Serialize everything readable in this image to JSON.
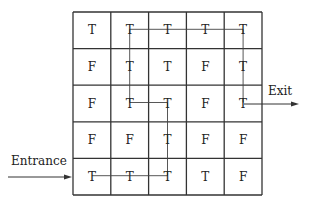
{
  "grid": {
    "rows": 5,
    "cols": 5,
    "x0": 73,
    "y0": 12,
    "cell_w": 37.8,
    "cell_h": 36.6,
    "cells": [
      [
        "T",
        "T",
        "T",
        "T",
        "T"
      ],
      [
        "F",
        "T",
        "T",
        "F",
        "T"
      ],
      [
        "F",
        "T",
        "T",
        "F",
        "T"
      ],
      [
        "F",
        "F",
        "T",
        "F",
        "F"
      ],
      [
        "T",
        "T",
        "T",
        "T",
        "F"
      ]
    ]
  },
  "path": {
    "description": "Route from entrance to exit through T cells",
    "cells": [
      [
        4,
        0
      ],
      [
        4,
        1
      ],
      [
        4,
        2
      ],
      [
        3,
        2
      ],
      [
        2,
        2
      ],
      [
        2,
        1
      ],
      [
        1,
        1
      ],
      [
        0,
        1
      ],
      [
        0,
        2
      ],
      [
        0,
        3
      ],
      [
        0,
        4
      ],
      [
        1,
        4
      ],
      [
        2,
        4
      ]
    ]
  },
  "labels": {
    "entrance": "Entrance",
    "exit": "Exit"
  },
  "colors": {
    "grid": "#333333",
    "path": "#444444",
    "text": "#222222"
  }
}
